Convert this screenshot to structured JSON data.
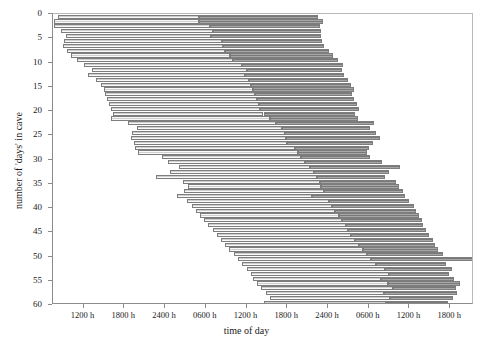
{
  "chart_data": {
    "type": "bar",
    "title": "",
    "subtitle": "",
    "xlabel": "time of day",
    "ylabel": "number of 'days' in cave",
    "orientation": "horizontal",
    "grid": false,
    "legend": null,
    "x_unit": "hours",
    "x_axis": {
      "ticks_hours": [
        12,
        18,
        24,
        30,
        36,
        42,
        48,
        54,
        60,
        66
      ],
      "tick_labels": [
        "1200 h",
        "1800 h",
        "2400 h",
        "0600 h",
        "1200 h",
        "1800 h",
        "2400 h",
        "0600 h",
        "1200 h",
        "1800 h"
      ],
      "min_hours": 7.5,
      "max_hours": 69.5
    },
    "y_axis": {
      "ticks": [
        0,
        5,
        10,
        15,
        20,
        25,
        30,
        35,
        40,
        45,
        50,
        55,
        60
      ],
      "tick_labels": [
        "0",
        "5",
        "10",
        "15",
        "20",
        "25",
        "30",
        "35",
        "40",
        "45",
        "50",
        "55",
        "60"
      ],
      "min": 0,
      "max": 60,
      "inverted": true
    },
    "series": [
      {
        "name": "wake",
        "color": "#e9e9e9",
        "description": "light hatched segment: time awake"
      },
      {
        "name": "sleep",
        "color": "#8e8e8e",
        "description": "dark hatched segment: time asleep"
      }
    ],
    "records": [
      {
        "day": 0,
        "wake_start": 8.2,
        "wake_end": 29.0,
        "sleep_start": 29.0,
        "sleep_end": 46.5
      },
      {
        "day": 1,
        "wake_start": 7.7,
        "wake_end": 29.0,
        "sleep_start": 29.0,
        "sleep_end": 47.2
      },
      {
        "day": 2,
        "wake_start": 7.6,
        "wake_end": 30.6,
        "sleep_start": 30.6,
        "sleep_end": 46.8
      },
      {
        "day": 3,
        "wake_start": 8.7,
        "wake_end": 31.0,
        "sleep_start": 31.0,
        "sleep_end": 47.0
      },
      {
        "day": 4,
        "wake_start": 9.4,
        "wake_end": 30.8,
        "sleep_start": 30.8,
        "sleep_end": 46.9
      },
      {
        "day": 5,
        "wake_start": 9.1,
        "wake_end": 32.4,
        "sleep_start": 32.4,
        "sleep_end": 47.1
      },
      {
        "day": 6,
        "wake_start": 9.0,
        "wake_end": 32.6,
        "sleep_start": 32.6,
        "sleep_end": 47.4
      },
      {
        "day": 7,
        "wake_start": 9.6,
        "wake_end": 32.8,
        "sleep_start": 32.8,
        "sleep_end": 48.2
      },
      {
        "day": 8,
        "wake_start": 10.2,
        "wake_end": 33.5,
        "sleep_start": 33.5,
        "sleep_end": 48.8
      },
      {
        "day": 9,
        "wake_start": 11.0,
        "wake_end": 34.0,
        "sleep_start": 34.0,
        "sleep_end": 49.5
      },
      {
        "day": 10,
        "wake_start": 12.0,
        "wake_end": 35.4,
        "sleep_start": 35.4,
        "sleep_end": 50.2
      },
      {
        "day": 11,
        "wake_start": 13.2,
        "wake_end": 36.0,
        "sleep_start": 36.0,
        "sleep_end": 50.0
      },
      {
        "day": 12,
        "wake_start": 12.6,
        "wake_end": 35.8,
        "sleep_start": 35.8,
        "sleep_end": 50.4
      },
      {
        "day": 13,
        "wake_start": 13.8,
        "wake_end": 36.3,
        "sleep_start": 36.3,
        "sleep_end": 51.0
      },
      {
        "day": 14,
        "wake_start": 14.6,
        "wake_end": 36.6,
        "sleep_start": 36.6,
        "sleep_end": 51.4
      },
      {
        "day": 15,
        "wake_start": 15.0,
        "wake_end": 37.0,
        "sleep_start": 37.0,
        "sleep_end": 51.8
      },
      {
        "day": 16,
        "wake_start": 15.2,
        "wake_end": 37.2,
        "sleep_start": 37.2,
        "sleep_end": 51.6
      },
      {
        "day": 17,
        "wake_start": 15.4,
        "wake_end": 37.6,
        "sleep_start": 37.6,
        "sleep_end": 51.9
      },
      {
        "day": 18,
        "wake_start": 15.8,
        "wake_end": 37.8,
        "sleep_start": 37.8,
        "sleep_end": 52.2
      },
      {
        "day": 19,
        "wake_start": 16.0,
        "wake_end": 38.0,
        "sleep_start": 38.0,
        "sleep_end": 52.6
      },
      {
        "day": 20,
        "wake_start": 16.4,
        "wake_end": 38.5,
        "sleep_start": 38.5,
        "sleep_end": 52.0
      },
      {
        "day": 21,
        "wake_start": 16.0,
        "wake_end": 39.4,
        "sleep_start": 39.4,
        "sleep_end": 52.4
      },
      {
        "day": 22,
        "wake_start": 18.6,
        "wake_end": 40.4,
        "sleep_start": 40.4,
        "sleep_end": 54.8
      },
      {
        "day": 23,
        "wake_start": 19.8,
        "wake_end": 41.2,
        "sleep_start": 41.2,
        "sleep_end": 54.2
      },
      {
        "day": 24,
        "wake_start": 19.2,
        "wake_end": 41.6,
        "sleep_start": 41.6,
        "sleep_end": 55.0
      },
      {
        "day": 25,
        "wake_start": 19.0,
        "wake_end": 41.8,
        "sleep_start": 41.8,
        "sleep_end": 55.6
      },
      {
        "day": 26,
        "wake_start": 19.4,
        "wake_end": 42.0,
        "sleep_start": 42.0,
        "sleep_end": 54.6
      },
      {
        "day": 27,
        "wake_start": 19.6,
        "wake_end": 43.2,
        "sleep_start": 43.2,
        "sleep_end": 54.0
      },
      {
        "day": 28,
        "wake_start": 20.0,
        "wake_end": 43.6,
        "sleep_start": 43.6,
        "sleep_end": 53.8
      },
      {
        "day": 29,
        "wake_start": 23.6,
        "wake_end": 44.0,
        "sleep_start": 44.0,
        "sleep_end": 54.2
      },
      {
        "day": 30,
        "wake_start": 24.4,
        "wake_end": 44.6,
        "sleep_start": 44.6,
        "sleep_end": 56.0
      },
      {
        "day": 31,
        "wake_start": 26.0,
        "wake_end": 45.4,
        "sleep_start": 45.4,
        "sleep_end": 58.6
      },
      {
        "day": 32,
        "wake_start": 24.8,
        "wake_end": 46.0,
        "sleep_start": 46.0,
        "sleep_end": 57.0
      },
      {
        "day": 33,
        "wake_start": 22.6,
        "wake_end": 46.4,
        "sleep_start": 46.4,
        "sleep_end": 56.4
      },
      {
        "day": 34,
        "wake_start": 26.6,
        "wake_end": 46.8,
        "sleep_start": 46.8,
        "sleep_end": 58.0
      },
      {
        "day": 35,
        "wake_start": 27.4,
        "wake_end": 47.0,
        "sleep_start": 47.0,
        "sleep_end": 58.4
      },
      {
        "day": 36,
        "wake_start": 26.8,
        "wake_end": 47.4,
        "sleep_start": 47.4,
        "sleep_end": 59.0
      },
      {
        "day": 37,
        "wake_start": 25.8,
        "wake_end": 45.6,
        "sleep_start": 45.6,
        "sleep_end": 59.4
      },
      {
        "day": 38,
        "wake_start": 27.2,
        "wake_end": 48.2,
        "sleep_start": 48.2,
        "sleep_end": 60.0
      },
      {
        "day": 39,
        "wake_start": 28.0,
        "wake_end": 48.6,
        "sleep_start": 48.6,
        "sleep_end": 60.6
      },
      {
        "day": 40,
        "wake_start": 28.6,
        "wake_end": 49.0,
        "sleep_start": 49.0,
        "sleep_end": 61.0
      },
      {
        "day": 41,
        "wake_start": 29.2,
        "wake_end": 49.6,
        "sleep_start": 49.6,
        "sleep_end": 61.4
      },
      {
        "day": 42,
        "wake_start": 29.8,
        "wake_end": 50.0,
        "sleep_start": 50.0,
        "sleep_end": 61.8
      },
      {
        "day": 43,
        "wake_start": 30.4,
        "wake_end": 50.6,
        "sleep_start": 50.6,
        "sleep_end": 62.0
      },
      {
        "day": 44,
        "wake_start": 31.0,
        "wake_end": 51.0,
        "sleep_start": 51.0,
        "sleep_end": 62.4
      },
      {
        "day": 45,
        "wake_start": 31.6,
        "wake_end": 51.4,
        "sleep_start": 51.4,
        "sleep_end": 62.8
      },
      {
        "day": 46,
        "wake_start": 32.2,
        "wake_end": 52.0,
        "sleep_start": 52.0,
        "sleep_end": 63.4
      },
      {
        "day": 47,
        "wake_start": 32.8,
        "wake_end": 52.6,
        "sleep_start": 52.6,
        "sleep_end": 63.8
      },
      {
        "day": 48,
        "wake_start": 33.4,
        "wake_end": 53.2,
        "sleep_start": 53.2,
        "sleep_end": 64.2
      },
      {
        "day": 49,
        "wake_start": 34.2,
        "wake_end": 53.8,
        "sleep_start": 53.8,
        "sleep_end": 65.0
      },
      {
        "day": 50,
        "wake_start": 34.8,
        "wake_end": 54.4,
        "sleep_start": 54.4,
        "sleep_end": 69.4
      },
      {
        "day": 51,
        "wake_start": 35.4,
        "wake_end": 55.0,
        "sleep_start": 55.0,
        "sleep_end": 65.4
      },
      {
        "day": 52,
        "wake_start": 36.0,
        "wake_end": 56.4,
        "sleep_start": 56.4,
        "sleep_end": 66.2
      },
      {
        "day": 53,
        "wake_start": 36.6,
        "wake_end": 57.0,
        "sleep_start": 57.0,
        "sleep_end": 65.8
      },
      {
        "day": 54,
        "wake_start": 37.0,
        "wake_end": 55.8,
        "sleep_start": 55.8,
        "sleep_end": 66.6
      },
      {
        "day": 55,
        "wake_start": 37.6,
        "wake_end": 56.8,
        "sleep_start": 56.8,
        "sleep_end": 67.4
      },
      {
        "day": 56,
        "wake_start": 38.2,
        "wake_end": 57.6,
        "sleep_start": 57.6,
        "sleep_end": 66.8
      },
      {
        "day": 57,
        "wake_start": 38.8,
        "wake_end": 56.2,
        "sleep_start": 56.2,
        "sleep_end": 67.0
      },
      {
        "day": 58,
        "wake_start": 39.4,
        "wake_end": 57.2,
        "sleep_start": 57.2,
        "sleep_end": 66.4
      },
      {
        "day": 59,
        "wake_start": 38.6,
        "wake_end": 56.6,
        "sleep_start": 56.6,
        "sleep_end": 65.6
      }
    ]
  },
  "colors": {
    "wake": "#e9e9e9",
    "sleep": "#8e8e8e",
    "outline": "#7d7d7d",
    "axis": "#8c8c8c",
    "text": "#1a1a1a",
    "background": "#ffffff"
  }
}
